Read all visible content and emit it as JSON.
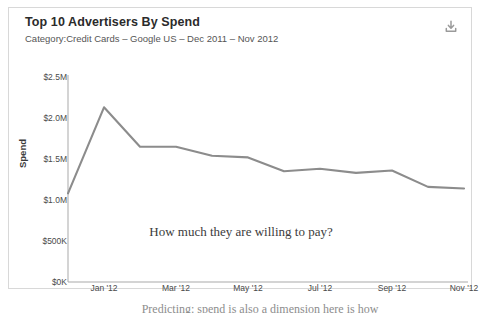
{
  "card": {
    "title": "Top 10 Advertisers By Spend",
    "subtitle": "Category:Credit Cards – Google US – Dec 2011 – Nov 2012",
    "download_icon": "download-icon",
    "download_tooltip": "Download"
  },
  "page": {
    "cutoff_text": "Predicting: spend is also a dimension here is how",
    "border_color": "#d8d8d8",
    "background": "#ffffff"
  },
  "chart_data": {
    "type": "line",
    "title": "Top 10 Advertisers By Spend",
    "subtitle": "Category:Credit Cards – Google US – Dec 2011 – Nov 2012",
    "xlabel": "",
    "ylabel": "Spend",
    "annotation": "How much they are willing to pay?",
    "line_color": "#8c8c8c",
    "axis_color": "#a9a9a9",
    "grid": false,
    "legend": false,
    "ylim": [
      0,
      2500000
    ],
    "ytick_values": [
      0,
      500000,
      1000000,
      1500000,
      2000000,
      2500000
    ],
    "ytick_labels": [
      "$0K",
      "$500K",
      "$1.0M",
      "$1.5M",
      "$2.0M",
      "$2.5M"
    ],
    "xtick_labels": [
      "Jan '12",
      "Mar '12",
      "May '12",
      "Jul '12",
      "Sep '12",
      "Nov '12"
    ],
    "xtick_indices": [
      1,
      3,
      5,
      7,
      9,
      11
    ],
    "x": [
      "Dec '11",
      "Jan '12",
      "Feb '12",
      "Mar '12",
      "Apr '12",
      "May '12",
      "Jun '12",
      "Jul '12",
      "Aug '12",
      "Sep '12",
      "Oct '12",
      "Nov '12"
    ],
    "values": [
      1080000,
      2130000,
      1650000,
      1650000,
      1540000,
      1520000,
      1350000,
      1380000,
      1330000,
      1360000,
      1160000,
      1140000
    ],
    "series": [
      {
        "name": "Spend",
        "values": [
          1080000,
          2130000,
          1650000,
          1650000,
          1540000,
          1520000,
          1350000,
          1380000,
          1330000,
          1360000,
          1160000,
          1140000
        ]
      }
    ]
  }
}
